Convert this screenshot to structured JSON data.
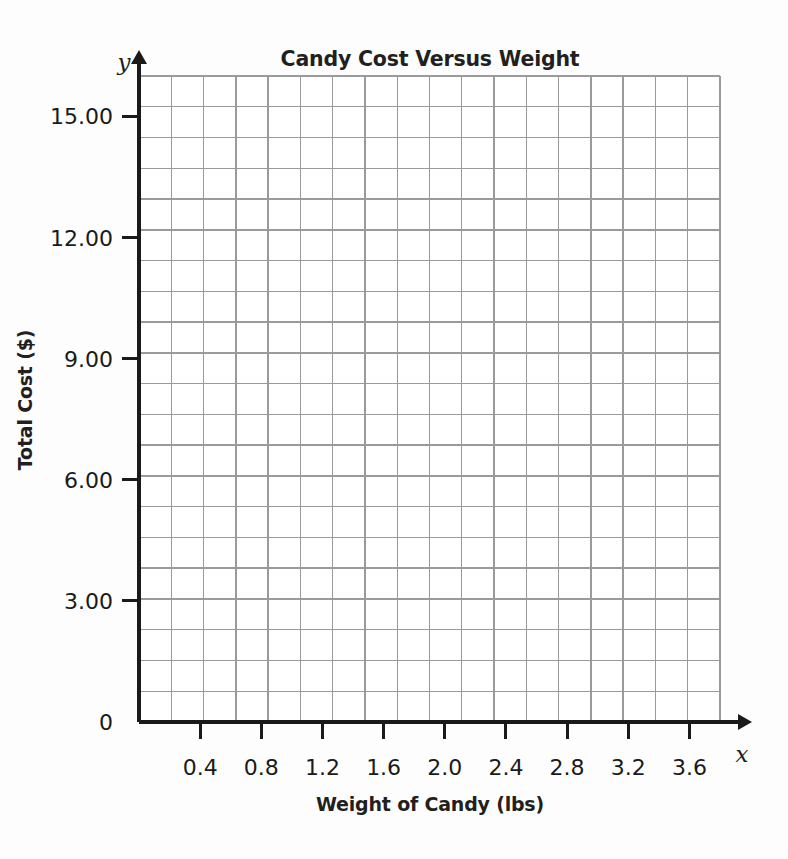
{
  "chart_data": {
    "type": "scatter",
    "title": "Candy Cost Versus Weight",
    "xlabel": "Weight of Candy (lbs)",
    "ylabel": "Total Cost ($)",
    "x_axis_letter": "x",
    "y_axis_letter": "y",
    "origin_label": "0",
    "xlim": [
      0,
      3.8
    ],
    "ylim": [
      0,
      16.0
    ],
    "x_ticks": [
      0.4,
      0.8,
      1.2,
      1.6,
      2.0,
      2.4,
      2.8,
      3.2,
      3.6
    ],
    "x_tick_labels": [
      "0.4",
      "0.8",
      "1.2",
      "1.6",
      "2.0",
      "2.4",
      "2.8",
      "3.2",
      "3.6"
    ],
    "y_ticks": [
      0,
      3,
      6,
      9,
      12,
      15
    ],
    "y_tick_labels": [
      "0",
      "3.00",
      "6.00",
      "9.00",
      "12.00",
      "15.00"
    ],
    "x_minor_step": 0.2,
    "y_minor_step": 0.75,
    "grid": true,
    "grid_columns": 18,
    "grid_rows": 21,
    "series": [],
    "values": [],
    "categories": [],
    "annotations": [],
    "legend": null,
    "colors": {
      "grid": "#9a9a9a",
      "axis": "#1a1a1a",
      "text": "#231f20",
      "background": "#fdfdfd",
      "plot_background": "#ffffff"
    }
  }
}
